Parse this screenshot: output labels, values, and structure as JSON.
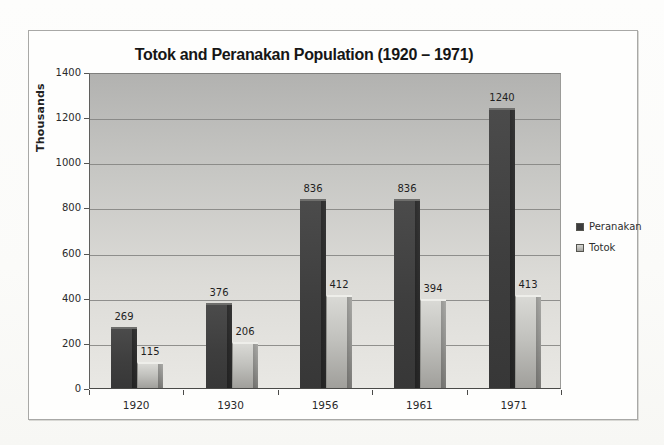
{
  "chart_data": {
    "type": "bar",
    "title": "Totok and Peranakan Population (1920 – 1971)",
    "xlabel": "",
    "ylabel": "Thousands",
    "categories": [
      "1920",
      "1930",
      "1956",
      "1961",
      "1971"
    ],
    "series": [
      {
        "name": "Peranakan",
        "values": [
          269,
          376,
          836,
          836,
          1240
        ],
        "color": "#3e3e3e"
      },
      {
        "name": "Totok",
        "values": [
          115,
          206,
          412,
          394,
          413
        ],
        "color": "#b6b6b2"
      }
    ],
    "ylim": [
      0,
      1400
    ],
    "yticks": [
      0,
      200,
      400,
      600,
      800,
      1000,
      1200,
      1400
    ],
    "grid": true,
    "data_labels": true,
    "legend_position": "right"
  }
}
